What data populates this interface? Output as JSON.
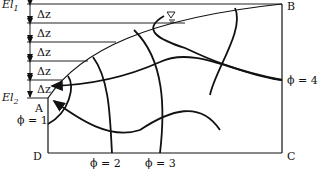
{
  "figure": {
    "elevation_labels": {
      "top": "El",
      "top_sub": "1",
      "bottom": "El",
      "bottom_sub": "2"
    },
    "delta_label": "Δz",
    "delta_count": 5,
    "corner_labels": {
      "A": "A",
      "B": "B",
      "C": "C",
      "D": "D"
    },
    "equipotentials": [
      {
        "id": 1,
        "label": "ϕ = 1"
      },
      {
        "id": 2,
        "label": "ϕ = 2"
      },
      {
        "id": 3,
        "label": "ϕ = 3"
      },
      {
        "id": 4,
        "label": "ϕ = 4"
      }
    ],
    "water_table_symbol": "▽"
  }
}
